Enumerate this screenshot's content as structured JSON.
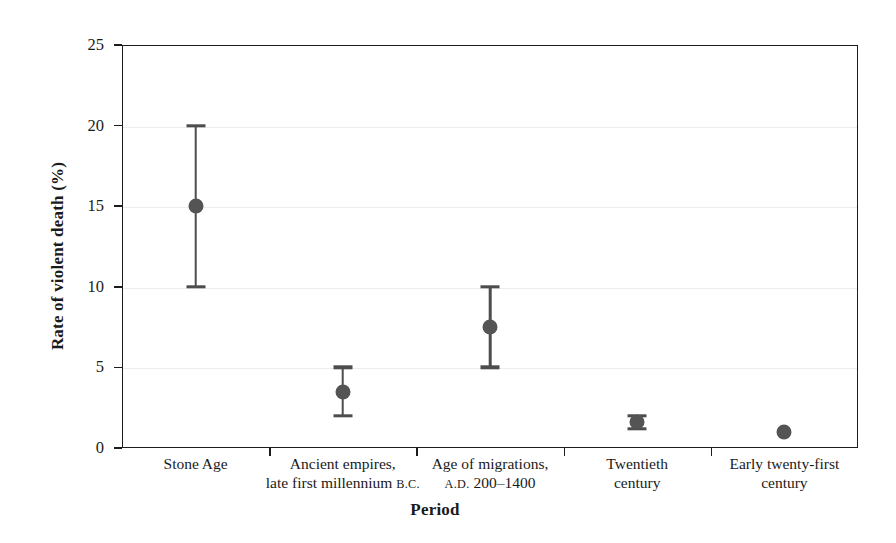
{
  "chart_data": {
    "type": "scatter",
    "title": "",
    "xlabel": "Period",
    "ylabel": "Rate of violent death (%)",
    "ylim": [
      0,
      25
    ],
    "yticks": [
      0,
      5,
      10,
      15,
      20,
      25
    ],
    "ytick_labels": [
      "0",
      "5",
      "10",
      "15",
      "20",
      "25"
    ],
    "grid": "horizontal",
    "legend": "none",
    "categories": [
      "Stone Age",
      "Ancient empires, late first millennium B.C.",
      "Age of migrations, A.D. 200–1400",
      "Twentieth century",
      "Early twenty-first century"
    ],
    "category_labels": [
      {
        "line1": "Stone Age",
        "line2": "",
        "era1": "",
        "era2": ""
      },
      {
        "line1": "Ancient empires,",
        "line2": "late first millennium ",
        "era2": "B.C."
      },
      {
        "line1": "Age of migrations,",
        "line2_pre_era": "A.D.",
        "line2": " 200–1400"
      },
      {
        "line1": "Twentieth",
        "line2": "century"
      },
      {
        "line1": "Early twenty-first",
        "line2": "century"
      }
    ],
    "values": [
      15.0,
      3.5,
      7.5,
      1.6,
      1.0
    ],
    "error_low": [
      10.0,
      2.0,
      5.0,
      1.2,
      null
    ],
    "error_high": [
      20.0,
      5.0,
      10.0,
      2.0,
      null
    ],
    "marker_color": "#545454",
    "errorbar_color": "#4d4d4d",
    "axis_color": "#1c1c1c",
    "grid_color": "#ececec",
    "background": "#ffffff"
  }
}
